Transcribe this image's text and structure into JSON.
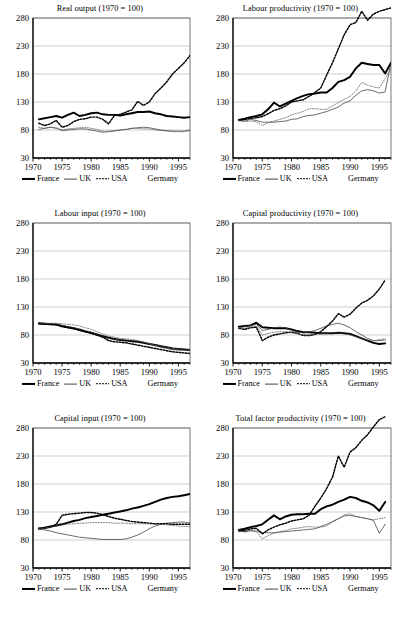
{
  "figure": {
    "panel_count": 6,
    "legend": [
      {
        "label": "France",
        "style": "thick-solid",
        "color": "#000000"
      },
      {
        "label": "UK",
        "style": "thin-solid",
        "color": "#444444"
      },
      {
        "label": "USA",
        "style": "coarse-dotted",
        "color": "#000000"
      },
      {
        "label": "Germany",
        "style": "fine-dotted",
        "color": "#555555"
      }
    ]
  },
  "axes": {
    "yticks": [
      30,
      80,
      130,
      180,
      230,
      280
    ],
    "xticks": [
      1970,
      1975,
      1980,
      1985,
      1990,
      1995
    ],
    "xlim": [
      1970,
      1997
    ],
    "ylim": [
      30,
      280
    ],
    "xminor_step": 1,
    "grid": "horizontal"
  },
  "chart_data": [
    {
      "type": "line",
      "title": "Real output (1970  = 100)",
      "xlabel": "",
      "ylabel": "",
      "xlim": [
        1970,
        1997
      ],
      "ylim": [
        30,
        280
      ],
      "grid": true,
      "legend_position": "below",
      "x": [
        1971,
        1972,
        1973,
        1974,
        1975,
        1976,
        1977,
        1978,
        1979,
        1980,
        1981,
        1982,
        1983,
        1984,
        1985,
        1986,
        1987,
        1988,
        1989,
        1990,
        1991,
        1992,
        1993,
        1994,
        1995,
        1996,
        1997
      ],
      "series": [
        {
          "name": "France",
          "values": [
            99,
            101,
            103,
            105,
            102,
            107,
            111,
            105,
            107,
            110,
            111,
            108,
            107,
            107,
            106,
            108,
            110,
            112,
            112,
            113,
            110,
            108,
            105,
            104,
            103,
            102,
            103
          ]
        },
        {
          "name": "UK",
          "values": [
            81,
            83,
            85,
            83,
            79,
            80,
            81,
            82,
            82,
            80,
            78,
            76,
            77,
            78,
            80,
            81,
            83,
            84,
            85,
            84,
            82,
            80,
            79,
            78,
            78,
            78,
            80
          ]
        },
        {
          "name": "USA",
          "values": [
            92,
            88,
            91,
            97,
            85,
            88,
            95,
            99,
            100,
            103,
            103,
            99,
            91,
            106,
            108,
            112,
            116,
            131,
            124,
            130,
            145,
            155,
            166,
            180,
            190,
            200,
            213
          ]
        },
        {
          "name": "Germany",
          "values": [
            85,
            83,
            85,
            84,
            80,
            82,
            83,
            84,
            85,
            83,
            81,
            78,
            78,
            79,
            80,
            81,
            83,
            83,
            82,
            82,
            80,
            79,
            78,
            77,
            77,
            77,
            79
          ]
        }
      ]
    },
    {
      "type": "line",
      "title": "Labour productivity (1970  = 100)",
      "xlabel": "",
      "ylabel": "",
      "xlim": [
        1970,
        1997
      ],
      "ylim": [
        30,
        280
      ],
      "grid": true,
      "legend_position": "below",
      "x": [
        1971,
        1972,
        1973,
        1974,
        1975,
        1976,
        1977,
        1978,
        1979,
        1980,
        1981,
        1982,
        1983,
        1984,
        1985,
        1986,
        1987,
        1988,
        1989,
        1990,
        1991,
        1992,
        1993,
        1994,
        1995,
        1996,
        1997
      ],
      "series": [
        {
          "name": "France",
          "values": [
            98,
            100,
            103,
            105,
            108,
            117,
            129,
            122,
            127,
            132,
            137,
            141,
            144,
            145,
            147,
            147,
            155,
            166,
            169,
            175,
            190,
            200,
            198,
            196,
            196,
            181,
            200
          ]
        },
        {
          "name": "UK",
          "values": [
            97,
            96,
            99,
            97,
            94,
            94,
            94,
            95,
            96,
            99,
            100,
            104,
            106,
            107,
            110,
            113,
            117,
            121,
            128,
            132,
            142,
            150,
            152,
            150,
            146,
            148,
            200
          ]
        },
        {
          "name": "USA",
          "values": [
            97,
            99,
            101,
            102,
            104,
            109,
            115,
            118,
            123,
            130,
            132,
            134,
            140,
            147,
            155,
            178,
            200,
            225,
            250,
            268,
            272,
            292,
            276,
            287,
            292,
            295,
            298
          ]
        },
        {
          "name": "Germany",
          "values": [
            97,
            95,
            96,
            95,
            88,
            93,
            96,
            99,
            102,
            107,
            110,
            113,
            118,
            118,
            117,
            117,
            123,
            129,
            135,
            140,
            150,
            165,
            160,
            157,
            155,
            172,
            190
          ]
        }
      ]
    },
    {
      "type": "line",
      "title": "Labour input (1970  = 100)",
      "xlabel": "",
      "ylabel": "",
      "xlim": [
        1970,
        1997
      ],
      "ylim": [
        30,
        280
      ],
      "grid": true,
      "legend_position": "below",
      "x": [
        1971,
        1972,
        1973,
        1974,
        1975,
        1976,
        1977,
        1978,
        1979,
        1980,
        1981,
        1982,
        1983,
        1984,
        1985,
        1986,
        1987,
        1988,
        1989,
        1990,
        1991,
        1992,
        1993,
        1994,
        1995,
        1996,
        1997
      ],
      "series": [
        {
          "name": "France",
          "values": [
            101,
            100,
            99,
            99,
            96,
            94,
            92,
            89,
            86,
            84,
            81,
            78,
            75,
            73,
            71,
            70,
            69,
            68,
            66,
            64,
            62,
            60,
            58,
            56,
            55,
            54,
            53
          ]
        },
        {
          "name": "UK",
          "values": [
            101,
            100,
            100,
            99,
            97,
            95,
            93,
            91,
            88,
            85,
            81,
            77,
            74,
            73,
            72,
            71,
            70,
            69,
            67,
            64,
            61,
            58,
            56,
            54,
            53,
            53,
            53
          ]
        },
        {
          "name": "USA",
          "values": [
            100,
            99,
            99,
            98,
            95,
            93,
            91,
            89,
            86,
            83,
            80,
            76,
            70,
            68,
            67,
            66,
            64,
            62,
            60,
            58,
            56,
            54,
            52,
            50,
            49,
            48,
            47
          ]
        },
        {
          "name": "Germany",
          "values": [
            102,
            101,
            101,
            101,
            100,
            99,
            98,
            96,
            93,
            90,
            86,
            82,
            78,
            76,
            74,
            73,
            72,
            70,
            68,
            65,
            62,
            60,
            58,
            56,
            55,
            55,
            55
          ]
        }
      ]
    },
    {
      "type": "line",
      "title": "Capital productivity (1970  = 100)",
      "xlabel": "",
      "ylabel": "",
      "xlim": [
        1970,
        1997
      ],
      "ylim": [
        30,
        280
      ],
      "grid": true,
      "legend_position": "below",
      "x": [
        1971,
        1972,
        1973,
        1974,
        1975,
        1976,
        1977,
        1978,
        1979,
        1980,
        1981,
        1982,
        1983,
        1984,
        1985,
        1986,
        1987,
        1988,
        1989,
        1990,
        1991,
        1992,
        1993,
        1994,
        1995,
        1996
      ],
      "series": [
        {
          "name": "France",
          "values": [
            95,
            96,
            97,
            102,
            94,
            93,
            92,
            92,
            92,
            90,
            87,
            85,
            85,
            84,
            83,
            83,
            83,
            84,
            83,
            82,
            78,
            74,
            70,
            66,
            64,
            65
          ]
        },
        {
          "name": "UK",
          "values": [
            93,
            95,
            97,
            99,
            88,
            90,
            93,
            94,
            93,
            88,
            85,
            84,
            85,
            88,
            92,
            96,
            99,
            101,
            98,
            93,
            86,
            80,
            74,
            70,
            70,
            71
          ]
        },
        {
          "name": "USA",
          "values": [
            92,
            90,
            93,
            94,
            70,
            76,
            80,
            82,
            84,
            85,
            83,
            79,
            79,
            81,
            86,
            95,
            105,
            118,
            112,
            117,
            128,
            137,
            142,
            150,
            162,
            178
          ]
        },
        {
          "name": "Germany",
          "values": [
            93,
            92,
            94,
            96,
            80,
            83,
            85,
            86,
            86,
            84,
            82,
            80,
            80,
            81,
            82,
            83,
            84,
            84,
            82,
            80,
            77,
            74,
            71,
            69,
            72,
            73
          ]
        }
      ]
    },
    {
      "type": "line",
      "title": "Capital input (1970  = 100)",
      "xlabel": "",
      "ylabel": "",
      "xlim": [
        1970,
        1997
      ],
      "ylim": [
        30,
        280
      ],
      "grid": true,
      "legend_position": "below",
      "x": [
        1971,
        1972,
        1973,
        1974,
        1975,
        1976,
        1977,
        1978,
        1979,
        1980,
        1981,
        1982,
        1983,
        1984,
        1985,
        1986,
        1987,
        1988,
        1989,
        1990,
        1991,
        1992,
        1993,
        1994,
        1995,
        1996,
        1997
      ],
      "series": [
        {
          "name": "France",
          "values": [
            100,
            102,
            104,
            106,
            108,
            111,
            114,
            116,
            119,
            121,
            123,
            125,
            127,
            129,
            131,
            133,
            136,
            138,
            141,
            144,
            148,
            152,
            155,
            157,
            158,
            160,
            162
          ]
        },
        {
          "name": "UK",
          "values": [
            100,
            98,
            96,
            93,
            91,
            89,
            87,
            85,
            84,
            83,
            82,
            81,
            81,
            81,
            81,
            82,
            85,
            89,
            94,
            100,
            105,
            108,
            110,
            111,
            112,
            112,
            110
          ]
        },
        {
          "name": "USA",
          "values": [
            101,
            101,
            103,
            108,
            124,
            126,
            127,
            128,
            129,
            129,
            128,
            125,
            122,
            119,
            117,
            115,
            113,
            112,
            111,
            110,
            109,
            109,
            109,
            108,
            108,
            108,
            108
          ]
        },
        {
          "name": "Germany",
          "values": [
            100,
            101,
            103,
            105,
            107,
            108,
            109,
            110,
            110,
            111,
            111,
            111,
            111,
            110,
            110,
            110,
            109,
            109,
            109,
            109,
            108,
            108,
            107,
            106,
            105,
            104,
            104
          ]
        }
      ]
    },
    {
      "type": "line",
      "title": "Total factor productivity (1970  = 100)",
      "xlabel": "",
      "ylabel": "",
      "xlim": [
        1970,
        1997
      ],
      "ylim": [
        30,
        280
      ],
      "grid": true,
      "legend_position": "below",
      "x": [
        1971,
        1972,
        1973,
        1974,
        1975,
        1976,
        1977,
        1978,
        1979,
        1980,
        1981,
        1982,
        1983,
        1984,
        1985,
        1986,
        1987,
        1988,
        1989,
        1990,
        1991,
        1992,
        1993,
        1994,
        1995,
        1996
      ],
      "series": [
        {
          "name": "France",
          "values": [
            98,
            100,
            103,
            105,
            108,
            116,
            124,
            117,
            122,
            125,
            126,
            126,
            127,
            127,
            135,
            140,
            143,
            148,
            152,
            157,
            155,
            150,
            147,
            142,
            132,
            148
          ]
        },
        {
          "name": "UK",
          "values": [
            96,
            95,
            97,
            96,
            93,
            93,
            93,
            94,
            95,
            96,
            97,
            98,
            99,
            100,
            104,
            108,
            113,
            118,
            123,
            124,
            122,
            120,
            118,
            115,
            92,
            108
          ]
        },
        {
          "name": "USA",
          "values": [
            96,
            97,
            100,
            101,
            91,
            98,
            103,
            107,
            110,
            114,
            116,
            118,
            124,
            140,
            155,
            172,
            192,
            230,
            210,
            237,
            245,
            258,
            268,
            282,
            295,
            300
          ]
        },
        {
          "name": "Germany",
          "values": [
            96,
            94,
            96,
            95,
            82,
            88,
            92,
            95,
            97,
            100,
            101,
            103,
            104,
            103,
            103,
            105,
            112,
            118,
            125,
            127,
            122,
            120,
            118,
            116,
            118,
            120
          ]
        }
      ]
    }
  ]
}
